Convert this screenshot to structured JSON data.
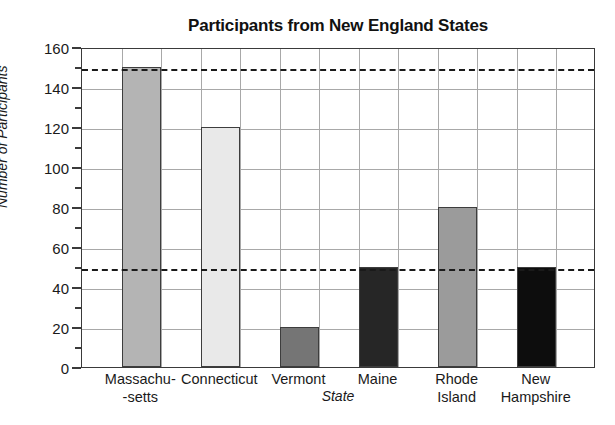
{
  "chart_data": {
    "type": "bar",
    "title": "Participants from New England States",
    "xlabel": "State",
    "ylabel": "Number of Participants",
    "categories": [
      "Massachu--setts",
      "Connecticut",
      "Vermont",
      "Maine",
      "Rhode Island",
      "New Hampshire"
    ],
    "category_lines": [
      [
        "Massachu-",
        "-setts"
      ],
      [
        "Connecticut"
      ],
      [
        "Vermont"
      ],
      [
        "Maine"
      ],
      [
        "Rhode Island"
      ],
      [
        "New",
        "Hampshire"
      ]
    ],
    "values": [
      150,
      120,
      20,
      50,
      80,
      50
    ],
    "bar_colors": [
      "#b4b4b4",
      "#e9e9e9",
      "#757575",
      "#262626",
      "#9b9b9b",
      "#0d0d0d"
    ],
    "ylim": [
      0,
      160
    ],
    "xlim_columns": 13,
    "bar_columns": [
      1,
      3,
      5,
      7,
      9,
      11
    ],
    "y_major_ticks": [
      0,
      20,
      40,
      60,
      80,
      100,
      120,
      140,
      160
    ],
    "y_minor_ticks": [
      10,
      30,
      50,
      70,
      90,
      110,
      130,
      150
    ],
    "y_tick_labels": [
      "0",
      "20",
      "40",
      "60",
      "80",
      "100",
      "120",
      "140",
      "160"
    ],
    "reference_lines": [
      150,
      50
    ],
    "grid": true,
    "grid_color": "#a8a8a8",
    "legend": "none",
    "axis_color": "#3a3a3a",
    "refline_color": "#1a1a1a"
  }
}
